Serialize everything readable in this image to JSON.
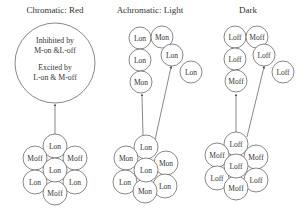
{
  "titles": {
    "chromatic": "Chromatic: Red",
    "achromatic": "Achromatic:  Light",
    "dark": "Dark"
  },
  "chromatic": {
    "big_circle": {
      "line1": "Inhibited by",
      "line2": "M-on &L-off",
      "line3": "Excited by",
      "line4": "L-on & M-off"
    },
    "rosette": [
      "Lon",
      "Moff",
      "Moff",
      "Lon",
      "Lon",
      "Lon",
      "Moff"
    ]
  },
  "achromatic": {
    "left_stack": [
      "Lon",
      "Lon",
      "Mon"
    ],
    "right_stack": [
      "Mon",
      "Lon",
      "Lon"
    ],
    "rosette": [
      "Lon",
      "Mon",
      "Mon",
      "Lon",
      "Lon",
      "Lon",
      "Mon"
    ]
  },
  "dark": {
    "left_stack": [
      "Loff",
      "Loff",
      "Moff"
    ],
    "right_stack": [
      "Moff",
      "Loff",
      "Loff"
    ],
    "rosette": [
      "Loff",
      "Moff",
      "Moff",
      "Loff",
      "Loff",
      "Loff",
      "Moff"
    ]
  }
}
